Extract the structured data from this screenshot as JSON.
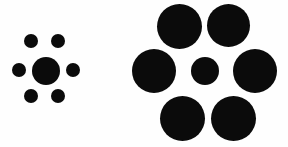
{
  "image": {
    "title": "Ebbinghaus Illusion",
    "alt_title": "Titchener Circles",
    "width": 288,
    "height": 147,
    "background_color": "#fefefe",
    "circle_color": "#0b0b0b",
    "description": "Two arrangements of black circles on a white background. Each arrangement has one central circle of the same size, surrounded by a ring of six flanker circles - small on the left, large on the right."
  },
  "figures": [
    {
      "id": "left-figure",
      "name": "small-inducers-figure",
      "label": "Center circle surrounded by small circles",
      "center_circle": {
        "name": "center-target-left",
        "label": "Left central target circle",
        "cx": 46,
        "cy": 71,
        "diameter": 28
      },
      "surrounding_circles": [
        {
          "name": "inducer-left-top-left",
          "label": "Top-left small circle",
          "cx": 31,
          "cy": 41,
          "diameter": 14
        },
        {
          "name": "inducer-left-top-right",
          "label": "Top-right small circle",
          "cx": 58,
          "cy": 41,
          "diameter": 14
        },
        {
          "name": "inducer-left-mid-left",
          "label": "Left small circle",
          "cx": 19,
          "cy": 70,
          "diameter": 14
        },
        {
          "name": "inducer-left-mid-right",
          "label": "Right small circle",
          "cx": 73,
          "cy": 70,
          "diameter": 14
        },
        {
          "name": "inducer-left-bottom-left",
          "label": "Bottom-left small circle",
          "cx": 31,
          "cy": 96,
          "diameter": 14
        },
        {
          "name": "inducer-left-bottom-right",
          "label": "Bottom-right small circle",
          "cx": 58,
          "cy": 96,
          "diameter": 14
        }
      ]
    },
    {
      "id": "right-figure",
      "name": "large-inducers-figure",
      "label": "Center circle surrounded by large circles",
      "center_circle": {
        "name": "center-target-right",
        "label": "Right central target circle",
        "cx": 205,
        "cy": 71,
        "diameter": 28
      },
      "surrounding_circles": [
        {
          "name": "inducer-right-top-left",
          "label": "Top-left large circle",
          "cx": 179,
          "cy": 26,
          "diameter": 45
        },
        {
          "name": "inducer-right-top-right",
          "label": "Top-right large circle",
          "cx": 228,
          "cy": 25,
          "diameter": 43
        },
        {
          "name": "inducer-right-mid-left",
          "label": "Left large circle",
          "cx": 154,
          "cy": 71,
          "diameter": 44
        },
        {
          "name": "inducer-right-mid-right",
          "label": "Right large circle",
          "cx": 255,
          "cy": 71,
          "diameter": 44
        },
        {
          "name": "inducer-right-bottom-left",
          "label": "Bottom-left large circle",
          "cx": 182,
          "cy": 118,
          "diameter": 45
        },
        {
          "name": "inducer-right-bottom-right",
          "label": "Bottom-right large circle",
          "cx": 233,
          "cy": 118,
          "diameter": 45
        }
      ]
    }
  ]
}
